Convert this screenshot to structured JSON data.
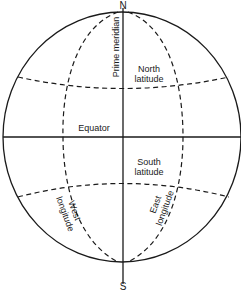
{
  "diagram": {
    "poles": {
      "north": "N",
      "south": "S"
    },
    "labels": {
      "prime_meridian": "Prime meridian",
      "north_latitude_line1": "North",
      "north_latitude_line2": "latitude",
      "equator": "Equator",
      "south_latitude_line1": "South",
      "south_latitude_line2": "latitude",
      "west_longitude_line1": "West",
      "west_longitude_line2": "longitude",
      "east_longitude_line1": "East",
      "east_longitude_line2": "longitude"
    },
    "colors": {
      "stroke": "#1a1a1a",
      "background": "#ffffff"
    }
  }
}
